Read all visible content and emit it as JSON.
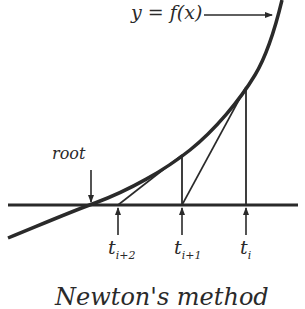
{
  "diagram": {
    "title": "Newton's method",
    "curve_label": "y = f(x)",
    "root_label": "root",
    "iterates": [
      {
        "base": "t",
        "sub": "i+2"
      },
      {
        "base": "t",
        "sub": "i+1"
      },
      {
        "base": "t",
        "sub": "i"
      }
    ],
    "colors": {
      "stroke": "#2a2a2a",
      "background": "#ffffff"
    }
  }
}
